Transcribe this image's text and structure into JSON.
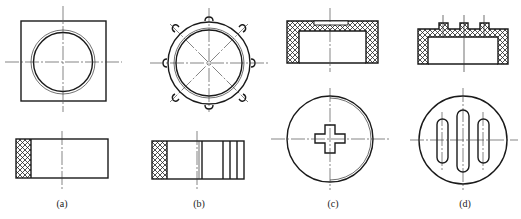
{
  "figure": {
    "panels": [
      {
        "id": "a",
        "label": "(a)",
        "label_x": 62,
        "label_y": 198,
        "top_view": "square with concentric circles",
        "front_view": "rectangle, knurled left edge"
      },
      {
        "id": "b",
        "label": "(b)",
        "label_x": 199,
        "label_y": 198,
        "top_view": "circle with 8 notched bumps and diagonal center lines",
        "front_view": "rectangle, knurled left edge, vertical lines on right"
      },
      {
        "id": "c",
        "label": "(c)",
        "label_x": 333,
        "label_y": 198,
        "top_view": "sectioned cap, hatched walls",
        "front_view": "circle with cross-shaped slot"
      },
      {
        "id": "d",
        "label": "(d)",
        "label_x": 465,
        "label_y": 198,
        "top_view": "sectioned cap with three raised ribs",
        "front_view": "circle with three elongated slots"
      }
    ],
    "colors": {
      "line": "#1a1a1a",
      "background": "#ffffff"
    }
  }
}
